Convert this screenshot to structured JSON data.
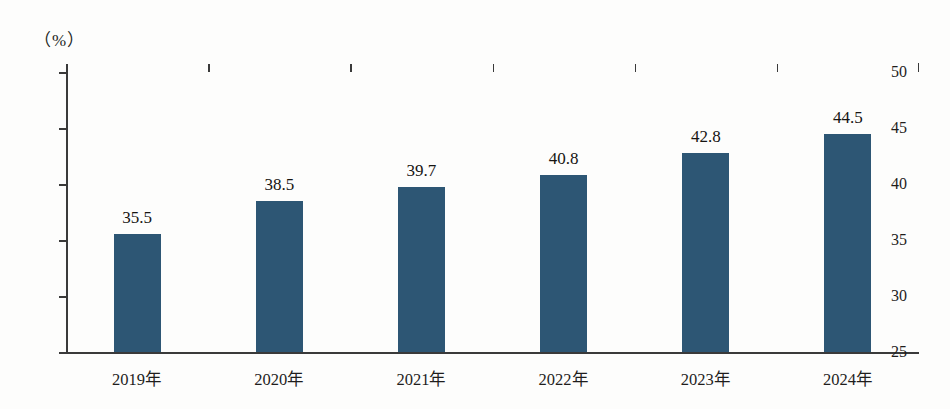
{
  "chart_data": {
    "type": "bar",
    "title": "",
    "subtitle": "",
    "xlabel": "",
    "ylabel": "",
    "unit_label": "（%）",
    "categories": [
      "2019年",
      "2020年",
      "2021年",
      "2022年",
      "2023年",
      "2024年"
    ],
    "values": [
      35.5,
      38.5,
      39.7,
      40.8,
      42.8,
      44.5
    ],
    "value_labels": [
      "35.5",
      "38.5",
      "39.7",
      "40.8",
      "42.8",
      "44.5"
    ],
    "ylim": [
      25,
      50
    ],
    "yticks": [
      50,
      45,
      40,
      35,
      30,
      25
    ],
    "ytick_labels": [
      "50",
      "45",
      "40",
      "35",
      "30",
      "25"
    ],
    "grid": false,
    "legend": false,
    "legend_position": "none",
    "bar_color": "#2d5674",
    "axis_color": "#3a3a3a",
    "text_color": "#1f1d1c",
    "background_color": "#fdfdfc"
  }
}
